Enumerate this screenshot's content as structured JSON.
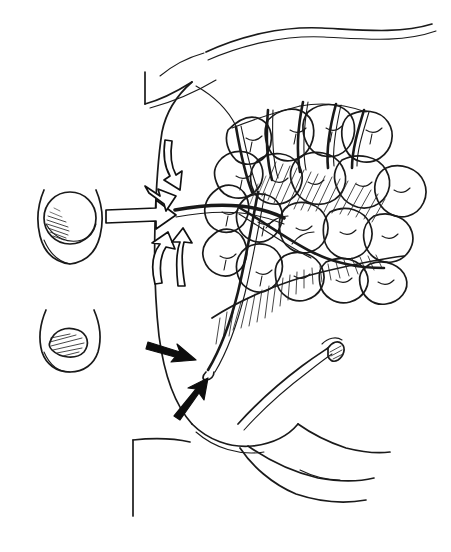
{
  "figure": {
    "kind": "hand-drawn anatomical line illustration",
    "background_color": "#ffffff",
    "ink_color": "#1a1a1a",
    "width_px": 451,
    "height_px": 552,
    "caption": ""
  },
  "insets": [
    {
      "name": "papilla-open-inset",
      "label": "",
      "state": "open",
      "description": "duodenal papilla viewed en face, orifice open, shaded lower-left",
      "center": [
        70,
        222
      ],
      "radius": 28
    },
    {
      "name": "papilla-closed-inset",
      "label": "",
      "state": "closed",
      "description": "duodenal papilla viewed en face, orifice collapsed/slit, hatched",
      "center": [
        70,
        340
      ],
      "radius": 24
    }
  ],
  "arrows": [
    {
      "name": "inset-pointer-arrow",
      "style": "open",
      "direction": "right",
      "from": [
        104,
        216
      ],
      "to": [
        170,
        216
      ],
      "meaning": "inset corresponds to papilla region"
    },
    {
      "name": "bile-flow-arrow",
      "style": "open",
      "direction": "down",
      "from": [
        168,
        140
      ],
      "to": [
        180,
        185
      ],
      "meaning": "flow descending toward papilla"
    },
    {
      "name": "duct-entry-arrow",
      "style": "open",
      "direction": "up-right",
      "from": [
        146,
        188
      ],
      "to": [
        176,
        208
      ],
      "meaning": "duct entering duodenal wall"
    },
    {
      "name": "reflux-arrow-left",
      "style": "open",
      "direction": "up",
      "from": [
        156,
        282
      ],
      "to": [
        166,
        236
      ],
      "meaning": "retrograde flow"
    },
    {
      "name": "reflux-arrow-right",
      "style": "open",
      "direction": "up",
      "from": [
        182,
        284
      ],
      "to": [
        182,
        234
      ],
      "meaning": "retrograde flow"
    },
    {
      "name": "probe-arrow-solid",
      "style": "solid",
      "direction": "right",
      "from": [
        150,
        346
      ],
      "to": [
        190,
        360
      ],
      "meaning": "points to transected duct"
    },
    {
      "name": "duct-tip-arrow-solid",
      "style": "solid",
      "direction": "up-right",
      "from": [
        178,
        414
      ],
      "to": [
        202,
        382
      ],
      "meaning": "points to duct stump"
    }
  ],
  "structures": [
    {
      "name": "duodenum-wall",
      "label": "",
      "kind": "hollow viscus outline"
    },
    {
      "name": "pancreas-body-lobules",
      "label": "",
      "kind": "lobulated gland",
      "lobule_count": 24
    },
    {
      "name": "pancreatic-duct-main",
      "label": "",
      "kind": "duct"
    },
    {
      "name": "pancreatic-duct-branches",
      "label": "",
      "kind": "duct branches",
      "branch_count": 6
    },
    {
      "name": "splenic-vessel",
      "label": "",
      "kind": "vessel pair, exits upper right"
    },
    {
      "name": "transected-duct-stump",
      "label": "",
      "kind": "cut tube with hatched lumen"
    },
    {
      "name": "peritoneal-cut-edge",
      "label": "",
      "kind": "L-shaped cut edge, upper left"
    },
    {
      "name": "mesentery-fold",
      "label": "",
      "kind": "folded membrane, lower right"
    },
    {
      "name": "vertical-cut-edge",
      "label": "",
      "kind": "straight cut edge, lower left"
    }
  ],
  "shading": [
    {
      "name": "pancreas-upper-hatching",
      "type": "parallel-line-hatching",
      "location": "center of gland"
    },
    {
      "name": "pancreas-lower-hatching",
      "type": "parallel-line-hatching",
      "location": "inferior gland border"
    },
    {
      "name": "papilla-open-shading",
      "type": "parallel-line-hatching",
      "location": "inset one, lower left of orifice"
    },
    {
      "name": "papilla-closed-shading",
      "type": "parallel-line-hatching",
      "location": "inset two, across orifice"
    }
  ]
}
